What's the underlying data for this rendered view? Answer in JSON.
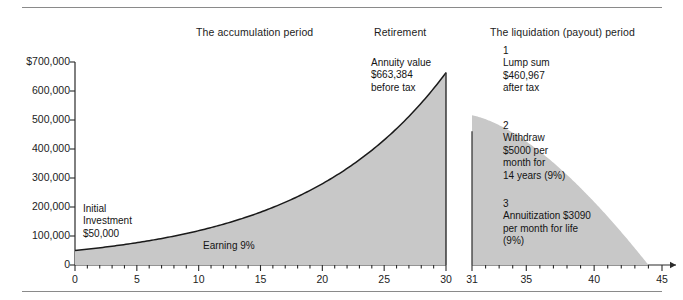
{
  "figure": {
    "headers": [
      {
        "id": "accumulation",
        "label": "The accumulation period"
      },
      {
        "id": "retirement",
        "label": "Retirement"
      },
      {
        "id": "liquidation",
        "label": "The liquidation (payout) period"
      }
    ],
    "annotations": [
      {
        "id": "annuity",
        "text": "Annuity value\n$663,384\nbefore tax"
      },
      {
        "id": "lumpsum",
        "text": "1\nLump sum\n$460,967\nafter tax"
      },
      {
        "id": "withdraw",
        "text": "2\nWithdraw\n$5000 per\nmonth for\n14 years (9%)"
      },
      {
        "id": "annuitize",
        "text": "3\nAnnuitization $3090\nper month for life\n(9%)"
      },
      {
        "id": "initial",
        "text": "Initial\nInvestment\n$50,000"
      },
      {
        "id": "earning",
        "text": "Earning 9%"
      }
    ],
    "colors": {
      "area_fill": "#c8c8c8",
      "curve_stroke": "#1a1a1a",
      "axis": "#2b2b2b",
      "rule": "#8a8a8a",
      "text": "#1a1a1a"
    }
  },
  "chart_data": {
    "type": "area",
    "title": "",
    "subtitle": "",
    "xlabel": "",
    "ylabel": "",
    "grid": false,
    "legend": null,
    "panels": [
      {
        "name": "accumulation",
        "description": "Initial investment of $50,000 compounding at 9% for 30 years",
        "xlim": [
          0,
          30
        ],
        "ylim": [
          0,
          700000
        ],
        "xticks": [
          0,
          5,
          10,
          15,
          20,
          25,
          30
        ],
        "xticklabels": [
          "0",
          "5",
          "10",
          "15",
          "20",
          "25",
          "30"
        ],
        "xminor_step": 1,
        "yticks": [
          0,
          100000,
          200000,
          300000,
          400000,
          500000,
          600000,
          700000
        ],
        "yticklabels": [
          "0",
          "100,000",
          "200,000",
          "300,000",
          "400,000",
          "500,000",
          "600,000",
          "$700,000"
        ],
        "rate_percent": 9,
        "initial_value": 50000,
        "final_value": 663384,
        "x": [
          0,
          2,
          4,
          6,
          8,
          10,
          12,
          14,
          16,
          18,
          20,
          22,
          24,
          26,
          28,
          30
        ],
        "y": [
          50000,
          59405,
          70575,
          83848,
          99616,
          118338,
          140580,
          167007,
          198407,
          235716,
          280040,
          332691,
          395222,
          469495,
          557729,
          662583
        ]
      },
      {
        "name": "liquidation",
        "description": "Lump sum of $460,967 after tax drawn down by $5000 monthly withdrawals at 9% over 14 years",
        "xlim": [
          31,
          45
        ],
        "ylim": [
          0,
          700000
        ],
        "xticks": [
          31,
          35,
          40,
          45
        ],
        "xticklabels": [
          "31",
          "35",
          "40",
          "45"
        ],
        "xminor_step": 1,
        "start_value": 460967,
        "depletion_year": 44,
        "withdrawal_per_month": 5000,
        "rate_percent": 9,
        "x": [
          31,
          32,
          33,
          34,
          35,
          36,
          37,
          38,
          39,
          40,
          41,
          42,
          43,
          44
        ],
        "y": [
          460967,
          443000,
          423000,
          400000,
          374000,
          345000,
          313000,
          277000,
          238000,
          195000,
          148000,
          100000,
          52000,
          0
        ]
      }
    ]
  }
}
